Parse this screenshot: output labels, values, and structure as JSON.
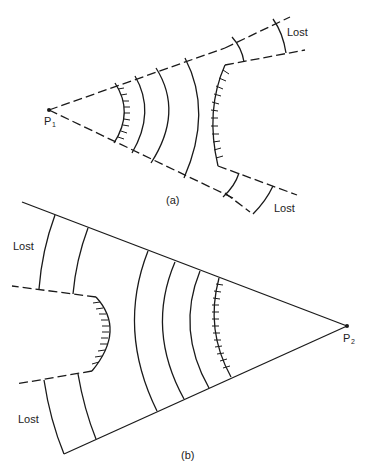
{
  "figure": {
    "panel_a": {
      "caption": "(a)",
      "source_label": "P",
      "source_subscript": "1",
      "lost_labels": [
        "Lost",
        "Lost"
      ],
      "boundary_style": "dashed",
      "description": "Wavefronts diverging from point source P1 within a dashed cone; wavefront passes a concave reflector and portions at the edges are lost"
    },
    "panel_b": {
      "caption": "(b)",
      "source_label": "P",
      "source_subscript": "2",
      "lost_labels": [
        "Lost",
        "Lost"
      ],
      "boundary_style": "solid",
      "description": "Wavefronts diverging from point source P2 within a solid cone; convex obstacle with dashed shadow edges, portions at the edges are lost"
    },
    "colors": {
      "line": "#1a1a1a",
      "background": "#ffffff"
    }
  }
}
